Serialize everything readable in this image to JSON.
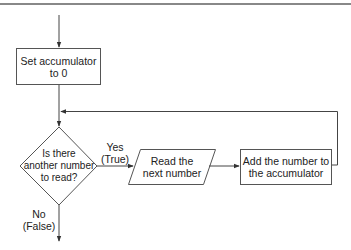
{
  "diagram": {
    "type": "flowchart",
    "nodes": [
      {
        "id": "init",
        "shape": "process",
        "lines": [
          "Set accumulator",
          "to 0"
        ]
      },
      {
        "id": "decision",
        "shape": "decision",
        "lines": [
          "Is there",
          "another number",
          "to read?"
        ]
      },
      {
        "id": "read",
        "shape": "input-output",
        "lines": [
          "Read the",
          "next number"
        ]
      },
      {
        "id": "add",
        "shape": "process",
        "lines": [
          "Add the number to",
          "the accumulator"
        ]
      }
    ],
    "edges": [
      {
        "from": "start",
        "to": "init"
      },
      {
        "from": "init",
        "to": "decision"
      },
      {
        "from": "decision",
        "to": "read",
        "label": [
          "Yes",
          "(True)"
        ]
      },
      {
        "from": "read",
        "to": "add"
      },
      {
        "from": "add",
        "to": "decision",
        "label": "loop back"
      },
      {
        "from": "decision",
        "to": "end",
        "label": [
          "No",
          "(False)"
        ]
      }
    ],
    "labels": {
      "yes": "Yes",
      "true": "(True)",
      "no": "No",
      "false": "(False)"
    },
    "colors": {
      "stroke": "#444444",
      "header_rule": "#888888",
      "background": "#ffffff"
    }
  }
}
